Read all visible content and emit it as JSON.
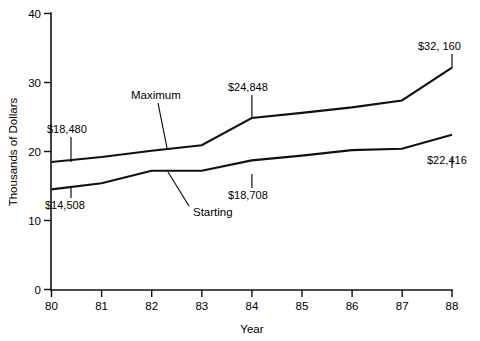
{
  "chart_data": {
    "type": "line",
    "title": "",
    "xlabel": "Year",
    "ylabel": "Thousands of Dollars",
    "x": [
      80,
      81,
      82,
      83,
      84,
      85,
      86,
      87,
      88
    ],
    "xticklabels": [
      "80",
      "81",
      "82",
      "83",
      "84",
      "85",
      "86",
      "87",
      "88"
    ],
    "yticklabels": [
      "0",
      "10",
      "20",
      "30",
      "40"
    ],
    "yticks": [
      0,
      10,
      20,
      30,
      40
    ],
    "ylim": [
      0,
      40
    ],
    "xlim": [
      80,
      88
    ],
    "grid": false,
    "legend": "inline-annotations",
    "series": [
      {
        "name": "Maximum",
        "values": [
          18.48,
          19.2,
          20.1,
          20.9,
          24.848,
          25.6,
          26.4,
          27.4,
          32.16
        ]
      },
      {
        "name": "Starting",
        "values": [
          14.508,
          15.4,
          17.2,
          17.2,
          18.708,
          19.4,
          20.2,
          20.4,
          22.416
        ]
      }
    ],
    "annotations": [
      {
        "text": "$18,480",
        "series": "Maximum",
        "year": 80,
        "value": 18.48
      },
      {
        "text": "$24,848",
        "series": "Maximum",
        "year": 84,
        "value": 24.848
      },
      {
        "text": "$32, 160",
        "series": "Maximum",
        "year": 88,
        "value": 32.16
      },
      {
        "text": "$14,508",
        "series": "Starting",
        "year": 80,
        "value": 14.508
      },
      {
        "text": "$18,708",
        "series": "Starting",
        "year": 84,
        "value": 18.708
      },
      {
        "text": "$22,416",
        "series": "Starting",
        "year": 88,
        "value": 22.416
      }
    ],
    "series_labels": [
      {
        "text": "Maximum",
        "points_to_year": 83
      },
      {
        "text": "Starting",
        "points_to_year": 82.5
      }
    ],
    "colors": {
      "line": "#111111",
      "background": "#ffffff",
      "text": "#000000"
    }
  },
  "axes": {
    "y_title": "Thousands of Dollars",
    "x_title": "Year",
    "y_ticks": [
      "40",
      "30",
      "20",
      "10",
      "0"
    ],
    "x_ticks": [
      "80",
      "81",
      "82",
      "83",
      "84",
      "85",
      "86",
      "87",
      "88"
    ]
  },
  "labels": {
    "max_start": "$18,480",
    "max_mid": "$24,848",
    "max_end": "$32, 160",
    "start_start": "$14,508",
    "start_mid": "$18,708",
    "start_end": "$22,416",
    "series_max": "Maximum",
    "series_start": "Starting"
  }
}
